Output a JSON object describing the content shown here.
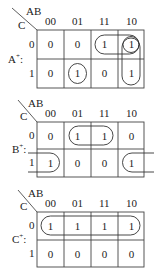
{
  "maps": [
    {
      "function_label": "A",
      "function_sup": "+",
      "function_suffix": ":",
      "row_var": "C",
      "col_var": "AB",
      "col_headers": [
        "00",
        "01",
        "11",
        "10"
      ],
      "row_headers": [
        "0",
        "1"
      ],
      "cells": [
        [
          "0",
          "0",
          "1",
          "1"
        ],
        [
          "0",
          "1",
          "0",
          "1"
        ]
      ],
      "groups": [
        {
          "desc": "row 0, cols 11-10"
        },
        {
          "desc": "col 10, rows 0-1"
        },
        {
          "desc": "single cell row1 col01"
        },
        {
          "desc": "single cell row0 col10"
        }
      ]
    },
    {
      "function_label": "B",
      "function_sup": "+",
      "function_suffix": ":",
      "row_var": "C",
      "col_var": "AB",
      "col_headers": [
        "00",
        "01",
        "11",
        "10"
      ],
      "row_headers": [
        "0",
        "1"
      ],
      "cells": [
        [
          "0",
          "1",
          "1",
          "0"
        ],
        [
          "1",
          "0",
          "0",
          "1"
        ]
      ],
      "groups": [
        {
          "desc": "row 0, cols 01-11"
        },
        {
          "desc": "row 1, cols 00 & 10 wrap-around"
        }
      ]
    },
    {
      "function_label": "C",
      "function_sup": "+",
      "function_suffix": ":",
      "row_var": "C",
      "col_var": "AB",
      "col_headers": [
        "00",
        "01",
        "11",
        "10"
      ],
      "row_headers": [
        "0",
        "1"
      ],
      "cells": [
        [
          "1",
          "1",
          "1",
          "1"
        ],
        [
          "0",
          "0",
          "0",
          "0"
        ]
      ],
      "groups": [
        {
          "desc": "row 0, all columns"
        }
      ]
    }
  ]
}
